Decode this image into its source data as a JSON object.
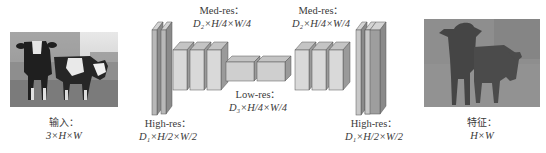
{
  "input": {
    "image": "cow-photo-grayscale",
    "title": "输入：",
    "dims": "3×H×W"
  },
  "output": {
    "image": "cow-segmentation-feature-map",
    "title": "特征：",
    "dims": "H×W"
  },
  "encoder_high": {
    "title": "High-res：",
    "dims": "D₁×H/2×W/2"
  },
  "encoder_med": {
    "title": "Med-res：",
    "dims": "D₂×H/4×W/4"
  },
  "bottleneck": {
    "title": "Low-res：",
    "dims": "D₃×H/4×W/4"
  },
  "decoder_med": {
    "title": "Med-res：",
    "dims": "D₂×H/4×W/4"
  },
  "decoder_high": {
    "title": "High-res：",
    "dims": "D₁×H/2×W/2"
  },
  "colors": {
    "slab_front": "#b8b8b8",
    "slab_side": "#8a8a8a",
    "slab_top": "#d4d4d4",
    "block_front": "#d9d9d9",
    "block_side": "#9a9a9a",
    "block_top": "#c4c4c4",
    "low_front": "#cfcfcf",
    "feature_bg": "#8c8c8c",
    "feature_fg": "#4a4a4a"
  }
}
